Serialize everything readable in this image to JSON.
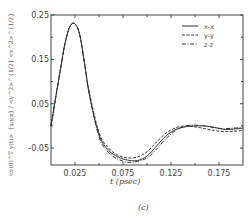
{
  "chart_data": {
    "type": "line",
    "title": "",
    "panel_label": "(c)",
    "xlabel": "t (psec)",
    "ylabel": "<v(0)^T v(t)>_{x,y,z} / <v^2>^{1/2} <v^2>^{1/2}",
    "xlim": [
      0.0,
      0.2
    ],
    "ylim": [
      -0.088,
      0.25
    ],
    "xticks": [
      0.025,
      0.075,
      0.125,
      0.175
    ],
    "xtick_labels": [
      "0.025",
      "0.075",
      "0.125",
      "0.175"
    ],
    "yticks": [
      -0.05,
      0.05,
      0.15,
      0.25
    ],
    "ytick_labels": [
      "-0.05",
      "0.05",
      "0.15",
      "0.25"
    ],
    "grid": false,
    "legend_position": "upper right",
    "x": [
      0.0,
      0.01,
      0.015,
      0.02,
      0.025,
      0.03,
      0.035,
      0.04,
      0.05,
      0.06,
      0.07,
      0.08,
      0.09,
      0.1,
      0.11,
      0.12,
      0.13,
      0.14,
      0.15,
      0.16,
      0.17,
      0.18,
      0.19,
      0.2
    ],
    "series": [
      {
        "name": "x-x",
        "style": "solid",
        "values": [
          0.0,
          0.13,
          0.19,
          0.225,
          0.23,
          0.205,
          0.14,
          0.07,
          -0.02,
          -0.055,
          -0.07,
          -0.077,
          -0.078,
          -0.068,
          -0.045,
          -0.022,
          -0.008,
          -0.002,
          0.0,
          0.0,
          -0.003,
          -0.008,
          -0.007,
          -0.005
        ]
      },
      {
        "name": "y-y",
        "style": "dashed",
        "values": [
          0.0,
          0.13,
          0.19,
          0.225,
          0.23,
          0.205,
          0.14,
          0.075,
          -0.015,
          -0.05,
          -0.066,
          -0.072,
          -0.07,
          -0.058,
          -0.036,
          -0.016,
          -0.004,
          0.0,
          -0.002,
          -0.006,
          -0.01,
          -0.013,
          -0.012,
          -0.01
        ]
      },
      {
        "name": "z-z",
        "style": "dashdot",
        "values": [
          0.0,
          0.13,
          0.19,
          0.225,
          0.23,
          0.205,
          0.14,
          0.07,
          -0.025,
          -0.06,
          -0.075,
          -0.082,
          -0.08,
          -0.072,
          -0.052,
          -0.028,
          -0.01,
          0.0,
          0.002,
          0.0,
          -0.004,
          -0.006,
          -0.005,
          -0.003
        ]
      }
    ]
  }
}
